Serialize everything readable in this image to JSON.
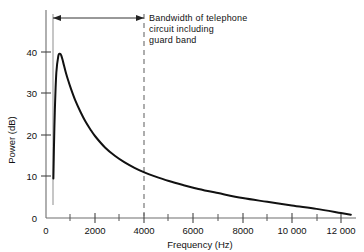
{
  "chart_data": {
    "type": "line",
    "title": "",
    "xlabel": "Frequency (Hz)",
    "ylabel": "Power (dB)",
    "xlim": [
      0,
      12600
    ],
    "ylim": [
      0,
      44
    ],
    "grid": false,
    "legend": null,
    "x_ticks_major": [
      0,
      2000,
      4000,
      6000,
      8000,
      10000,
      12000
    ],
    "x_tick_labels": [
      "0",
      "2000",
      "4000",
      "6000",
      "8000",
      "10 000",
      "12 000"
    ],
    "x_ticks_minor": [
      1000,
      3000,
      5000,
      7000,
      9000,
      11000
    ],
    "y_ticks_major": [
      0,
      10,
      20,
      30,
      40
    ],
    "y_tick_labels": [
      "0",
      "10",
      "20",
      "30",
      "40"
    ],
    "series": [
      {
        "name": "Speech power spectrum",
        "x": [
          300,
          320,
          360,
          420,
          500,
          560,
          620,
          700,
          800,
          900,
          1000,
          1200,
          1400,
          1600,
          1800,
          2000,
          2400,
          2800,
          3200,
          3600,
          4000,
          4400,
          5000,
          5600,
          6200,
          7000,
          8000,
          9000,
          10000,
          11000,
          12000,
          12400
        ],
        "y": [
          9.5,
          16,
          26,
          35,
          39,
          39.6,
          39.2,
          37.5,
          35.2,
          33.2,
          31.4,
          28.2,
          25.6,
          23.3,
          21.4,
          19.7,
          17.0,
          15.0,
          13.4,
          12.1,
          11.0,
          10.1,
          8.9,
          7.9,
          7.0,
          6.0,
          4.8,
          3.9,
          3.0,
          2.2,
          1.2,
          0.8
        ]
      }
    ],
    "annotations": [
      {
        "name": "bandwidth-span",
        "kind": "double-arrow",
        "x_start": 300,
        "x_end": 4000,
        "y_level_px": 18
      },
      {
        "name": "telephone-bandwidth-marker",
        "kind": "dashed-vertical",
        "x": 4000
      },
      {
        "name": "spectrum-start-marker",
        "kind": "solid-vertical",
        "x": 300
      }
    ]
  },
  "annotation": {
    "line1": "Bandwidth of telephone",
    "line2": "circuit including",
    "line3": "guard band"
  },
  "axes": {
    "x_title": "Frequency (Hz)",
    "y_title": "Power (dB)"
  },
  "colors": {
    "curve": "#111111",
    "axis": "#666666",
    "annotation": "#111111",
    "dashed": "#777777",
    "background": "#ffffff"
  }
}
